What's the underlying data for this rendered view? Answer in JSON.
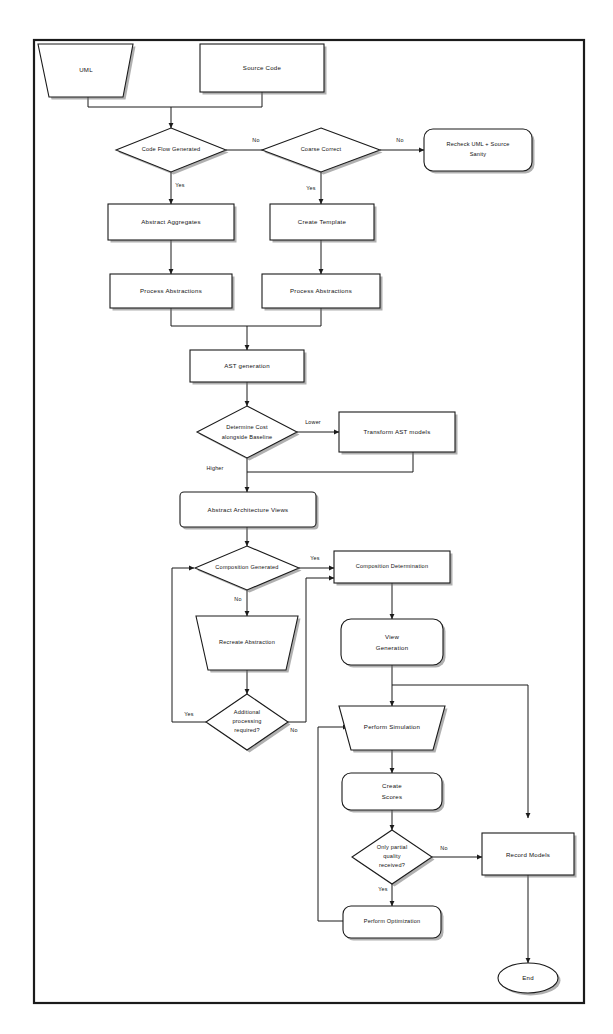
{
  "diagram": {
    "frame_color": "#1b1b1b",
    "node_fill": "#ffffff",
    "shadow_color": "#6f6f6f"
  },
  "nodes": {
    "uml": {
      "label": "UML",
      "shape": "trapezoid"
    },
    "source_code": {
      "label": "Source Code",
      "shape": "rect"
    },
    "code_flow_generated": {
      "label": "Code Flow Generated",
      "shape": "diamond"
    },
    "coarse_correct": {
      "label": "Coarse Correct",
      "shape": "diamond"
    },
    "recheck": {
      "line1": "Recheck UML + Source",
      "line2": "Sanity",
      "shape": "rounded-rect"
    },
    "abstract_aggregates": {
      "label": "Abstract Aggregates",
      "shape": "rect"
    },
    "create_template": {
      "label": "Create Template",
      "shape": "rect"
    },
    "process_abstractions_left": {
      "label": "Process Abstractions",
      "shape": "rect"
    },
    "process_abstractions_right": {
      "label": "Process Abstractions",
      "shape": "rect"
    },
    "ast_generation": {
      "label": "AST generation",
      "shape": "rect"
    },
    "determine_cost": {
      "line1": "Determine Cost",
      "line2": "alongside Baseline",
      "shape": "diamond"
    },
    "transform_ast": {
      "label": "Transform AST models",
      "shape": "rect"
    },
    "abstract_architecture_views": {
      "label": "Abstract Architecture Views",
      "shape": "rounded-rect"
    },
    "composition_generated": {
      "label": "Composition Generated",
      "shape": "diamond"
    },
    "composition_determination": {
      "label": "Composition Determination",
      "shape": "rect"
    },
    "recreate_abstraction": {
      "label": "Recreate Abstraction",
      "shape": "trapezoid"
    },
    "additional_processing": {
      "line1": "Additional",
      "line2": "processing",
      "line3": "required?",
      "shape": "diamond"
    },
    "view_generation": {
      "line1": "View",
      "line2": "Generation",
      "shape": "rounded-rect"
    },
    "perform_simulation": {
      "label": "Perform Simulation",
      "shape": "trapezoid"
    },
    "create_scores": {
      "line1": "Create",
      "line2": "Scores",
      "shape": "rounded-rect"
    },
    "only_partial_quality": {
      "line1": "Only partial",
      "line2": "quality",
      "line3": "received?",
      "shape": "diamond"
    },
    "record_models": {
      "label": "Record Models",
      "shape": "rect"
    },
    "perform_optimization": {
      "label": "Perform Optimization",
      "shape": "rounded-rect"
    },
    "end": {
      "label": "End",
      "shape": "ellipse"
    }
  },
  "edge_labels": {
    "code_flow_no": "No",
    "code_flow_yes": "Yes",
    "coarse_no": "No",
    "coarse_yes": "Yes",
    "cost_lower": "Lower",
    "cost_higher": "Higher",
    "composition_yes": "Yes",
    "composition_no": "No",
    "additional_yes": "Yes",
    "additional_no": "No",
    "quality_no": "No",
    "quality_yes": "Yes"
  },
  "edges": [
    {
      "from": "uml",
      "to": "code_flow_generated",
      "label": ""
    },
    {
      "from": "source_code",
      "to": "code_flow_generated",
      "label": ""
    },
    {
      "from": "code_flow_generated",
      "to": "coarse_correct",
      "label": "No"
    },
    {
      "from": "code_flow_generated",
      "to": "abstract_aggregates",
      "label": "Yes"
    },
    {
      "from": "coarse_correct",
      "to": "recheck",
      "label": "No"
    },
    {
      "from": "coarse_correct",
      "to": "create_template",
      "label": "Yes"
    },
    {
      "from": "abstract_aggregates",
      "to": "process_abstractions_left",
      "label": ""
    },
    {
      "from": "create_template",
      "to": "process_abstractions_right",
      "label": ""
    },
    {
      "from": "process_abstractions_left",
      "to": "ast_generation",
      "label": ""
    },
    {
      "from": "process_abstractions_right",
      "to": "ast_generation",
      "label": ""
    },
    {
      "from": "ast_generation",
      "to": "determine_cost",
      "label": ""
    },
    {
      "from": "determine_cost",
      "to": "transform_ast",
      "label": "Lower"
    },
    {
      "from": "determine_cost",
      "to": "abstract_architecture_views",
      "label": "Higher"
    },
    {
      "from": "transform_ast",
      "to": "abstract_architecture_views",
      "label": ""
    },
    {
      "from": "abstract_architecture_views",
      "to": "composition_generated",
      "label": ""
    },
    {
      "from": "composition_generated",
      "to": "composition_determination",
      "label": "Yes"
    },
    {
      "from": "composition_generated",
      "to": "recreate_abstraction",
      "label": "No"
    },
    {
      "from": "recreate_abstraction",
      "to": "additional_processing",
      "label": ""
    },
    {
      "from": "additional_processing",
      "to": "composition_generated",
      "label": "Yes"
    },
    {
      "from": "additional_processing",
      "to": "composition_determination",
      "label": "No"
    },
    {
      "from": "composition_determination",
      "to": "view_generation",
      "label": ""
    },
    {
      "from": "view_generation",
      "to": "perform_simulation",
      "label": ""
    },
    {
      "from": "view_generation",
      "to": "record_models",
      "label": ""
    },
    {
      "from": "perform_simulation",
      "to": "create_scores",
      "label": ""
    },
    {
      "from": "create_scores",
      "to": "only_partial_quality",
      "label": ""
    },
    {
      "from": "only_partial_quality",
      "to": "record_models",
      "label": "No"
    },
    {
      "from": "only_partial_quality",
      "to": "perform_optimization",
      "label": "Yes"
    },
    {
      "from": "perform_optimization",
      "to": "perform_simulation",
      "label": ""
    },
    {
      "from": "record_models",
      "to": "end",
      "label": ""
    }
  ]
}
